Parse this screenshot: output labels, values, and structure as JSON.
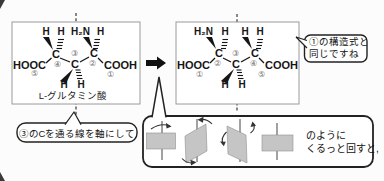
{
  "palette": {
    "ink": "#161616",
    "box_border": "#9a9a9a",
    "gray_fill": "#c5c5c5",
    "axis_dash": "#555555",
    "number_gray": "#6e6e6e"
  },
  "symbols": {
    "h": "H",
    "h2n": "H₂N",
    "c": "C",
    "hooc": "HOOC",
    "cooh": "COOH",
    "n1": "①",
    "n2": "②",
    "n3": "③",
    "n4": "④",
    "n5": "⑤"
  },
  "left_panel": {
    "caption": "L-グルタミン酸"
  },
  "callouts": {
    "axis_note": "③のCを通る線を軸にして",
    "same_structure_line1": "①の構造式と",
    "same_structure_line2": "同じですね",
    "rotate_line1": "のように",
    "rotate_line2": "くるっと回すと,"
  }
}
